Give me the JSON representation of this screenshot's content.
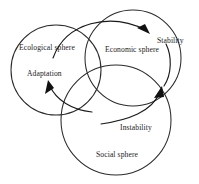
{
  "diagram": {
    "stroke_color": "#2b2b2b",
    "arrow_color": "#111111",
    "background_color": "#ffffff",
    "spheres": [
      {
        "id": "ecological",
        "label": "Ecological sphere",
        "cx": 56,
        "cy": 70,
        "r": 45
      },
      {
        "id": "economic",
        "label": "Economic sphere",
        "cx": 133,
        "cy": 58,
        "r": 48
      },
      {
        "id": "social",
        "label": "Social sphere",
        "cx": 116,
        "cy": 120,
        "r": 55
      }
    ],
    "concepts": [
      {
        "id": "adaptation",
        "label": "Adaptation"
      },
      {
        "id": "stability",
        "label": "Stability"
      },
      {
        "id": "instability",
        "label": "Instability"
      }
    ],
    "arrows": [
      {
        "id": "arrow-to-stability",
        "from": "ecological",
        "to": "stability",
        "direction": "right"
      },
      {
        "id": "arrow-to-adaptation",
        "from": "social",
        "to": "adaptation",
        "direction": "up-left"
      },
      {
        "id": "arrow-from-instability",
        "from": "instability",
        "to": "economic",
        "direction": "up-right"
      }
    ]
  }
}
